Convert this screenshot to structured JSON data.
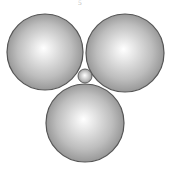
{
  "figure": {
    "label": "5",
    "colors": {
      "fill_edge": "#8c8c8c",
      "fill_mid": "#bdbdbd",
      "highlight": "#ffffff",
      "stroke": "#555555",
      "background": "#ffffff"
    },
    "spheres": [
      {
        "name": "large-sphere-top-left",
        "cx": 45,
        "cy": 52,
        "r": 38
      },
      {
        "name": "large-sphere-top-right",
        "cx": 125,
        "cy": 53,
        "r": 39
      },
      {
        "name": "large-sphere-bottom",
        "cx": 85,
        "cy": 123,
        "r": 39
      },
      {
        "name": "small-sphere-center",
        "cx": 85,
        "cy": 76,
        "r": 7
      }
    ]
  }
}
